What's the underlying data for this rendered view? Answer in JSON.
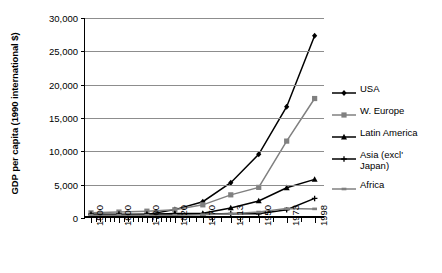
{
  "chart_data": {
    "type": "line",
    "title": "",
    "xlabel": "",
    "ylabel": "GDP per capita (1990 international $)",
    "ylim": [
      0,
      30000
    ],
    "ytick_labels": [
      "30,000",
      "25,000",
      "20,000",
      "15,000",
      "10,000",
      "5,000",
      "0"
    ],
    "ytick_values": [
      30000,
      25000,
      20000,
      15000,
      10000,
      5000,
      0
    ],
    "grid": true,
    "legend_position": "right",
    "categories": [
      "1500",
      "1600",
      "1700",
      "1820",
      "1870",
      "1913",
      "1950",
      "1973",
      "1998"
    ],
    "x": [
      1500,
      1600,
      1700,
      1820,
      1870,
      1913,
      1950,
      1973,
      1998
    ],
    "series": [
      {
        "name": "USA",
        "marker": "diamond",
        "color": "#000000",
        "values": [
          400,
          400,
          527,
          1257,
          2445,
          5301,
          9561,
          16689,
          27331
        ]
      },
      {
        "name": "W. Europe",
        "marker": "square",
        "color": "#808080",
        "values": [
          772,
          890,
          1024,
          1232,
          1974,
          3473,
          4594,
          11534,
          17921
        ]
      },
      {
        "name": "Latin America",
        "marker": "triangle",
        "color": "#000000",
        "values": [
          416,
          438,
          527,
          665,
          698,
          1511,
          2554,
          4531,
          5795
        ]
      },
      {
        "name": "Asia (excl'\nJapan)",
        "marker": "cross",
        "color": "#000000",
        "values": [
          572,
          576,
          572,
          577,
          550,
          658,
          635,
          1231,
          2936
        ]
      },
      {
        "name": "Africa",
        "marker": "dash",
        "color": "#808080",
        "values": [
          414,
          422,
          421,
          420,
          500,
          637,
          894,
          1410,
          1368
        ]
      }
    ]
  }
}
